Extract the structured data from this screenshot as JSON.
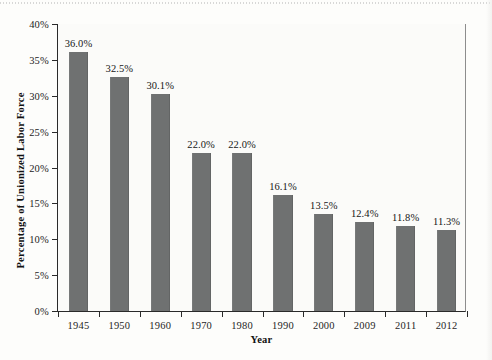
{
  "chart_data": {
    "type": "bar",
    "title": "",
    "xlabel": "Year",
    "ylabel": "Percentage of Unionized Labor Force",
    "categories": [
      "1945",
      "1950",
      "1960",
      "1970",
      "1980",
      "1990",
      "2000",
      "2009",
      "2011",
      "2012"
    ],
    "values": [
      36.0,
      32.5,
      30.1,
      22.0,
      22.0,
      16.1,
      13.5,
      12.4,
      11.8,
      11.3
    ],
    "value_labels": [
      "36.0%",
      "32.5%",
      "30.1%",
      "22.0%",
      "22.0%",
      "16.1%",
      "13.5%",
      "12.4%",
      "11.8%",
      "11.3%"
    ],
    "ylim": [
      0,
      40
    ],
    "ytick_values": [
      0,
      5,
      10,
      15,
      20,
      25,
      30,
      35,
      40
    ],
    "ytick_labels": [
      "0%",
      "5%",
      "10%",
      "15%",
      "20%",
      "25%",
      "30%",
      "35%",
      "40%"
    ],
    "grid": false,
    "legend": false,
    "bar_color": "#6f7171",
    "axis_color": "#2a2a2a",
    "plot_background": "#fbfbf9"
  }
}
